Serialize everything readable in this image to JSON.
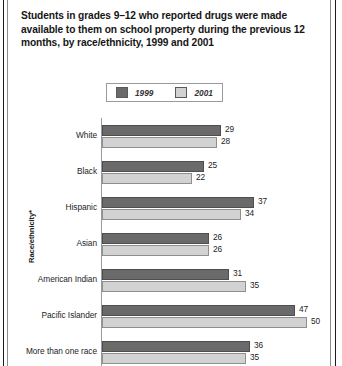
{
  "title": "Students in grades 9–12 who reported drugs were made available to them on school property during the previous 12 months, by race/ethnicity, 1999 and 2001",
  "axis_title": "Race/ethnicity*",
  "legend": {
    "position": "top",
    "entries": [
      {
        "label": "1999",
        "color": "#6a6a6a"
      },
      {
        "label": "2001",
        "color": "#d2d2d2"
      }
    ]
  },
  "chart_data": {
    "type": "bar",
    "orientation": "horizontal",
    "title": "Students in grades 9–12 who reported drugs were made available to them on school property during the previous 12 months, by race/ethnicity, 1999 and 2001",
    "xlabel": "",
    "ylabel": "Race/ethnicity*",
    "categories": [
      "White",
      "Black",
      "Hispanic",
      "Asian",
      "American Indian",
      "Pacific Islander",
      "More than one race"
    ],
    "series": [
      {
        "name": "1999",
        "color": "#6a6a6a",
        "values": [
          29,
          25,
          37,
          26,
          31,
          47,
          36
        ]
      },
      {
        "name": "2001",
        "color": "#d2d2d2",
        "values": [
          28,
          22,
          34,
          26,
          35,
          50,
          35
        ]
      }
    ],
    "xlim": [
      0,
      50
    ],
    "grid": false,
    "legend_position": "top",
    "data_labels": true
  }
}
